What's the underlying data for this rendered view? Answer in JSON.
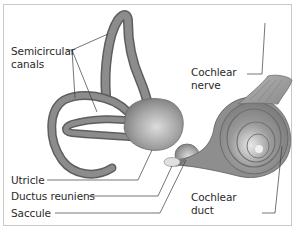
{
  "diagram": {
    "labels": {
      "semicircular_canals": [
        "Semicircular",
        "canals"
      ],
      "cochlear_nerve": [
        "Cochlear",
        "nerve"
      ],
      "utricle": "Utricle",
      "ductus_reuniens": "Ductus reuniens",
      "saccule": "Saccule",
      "cochlear_duct": [
        "Cochlear",
        "duct"
      ]
    },
    "colors": {
      "structure_fill": "#8c8c8c",
      "structure_edge": "#5e5e5e",
      "highlight": "#d9d9d9",
      "leader_line": "#3a3a3a",
      "frame": "#c8c8c8",
      "text": "#2a2a2a"
    }
  }
}
